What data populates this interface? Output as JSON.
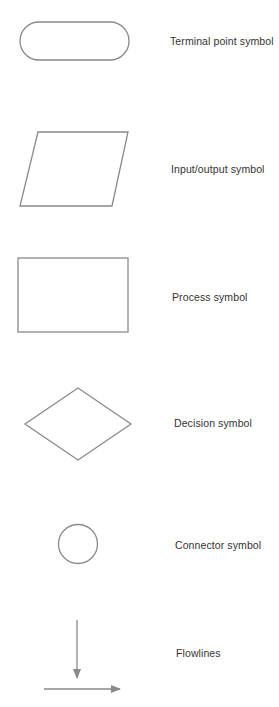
{
  "diagram": {
    "type": "flowchart-symbol-legend",
    "stroke_color": "#8a8a8a",
    "text_color": "#333333",
    "background": "#ffffff",
    "symbols": [
      {
        "id": "terminal",
        "shape": "rounded-rectangle",
        "label": "Terminal point symbol"
      },
      {
        "id": "io",
        "shape": "parallelogram",
        "label": "Input/output symbol"
      },
      {
        "id": "process",
        "shape": "rectangle",
        "label": "Process symbol"
      },
      {
        "id": "decision",
        "shape": "diamond",
        "label": "Decision symbol"
      },
      {
        "id": "connector",
        "shape": "circle",
        "label": "Connector symbol"
      },
      {
        "id": "flowlines",
        "shape": "arrows",
        "label": "Flowlines"
      }
    ]
  }
}
